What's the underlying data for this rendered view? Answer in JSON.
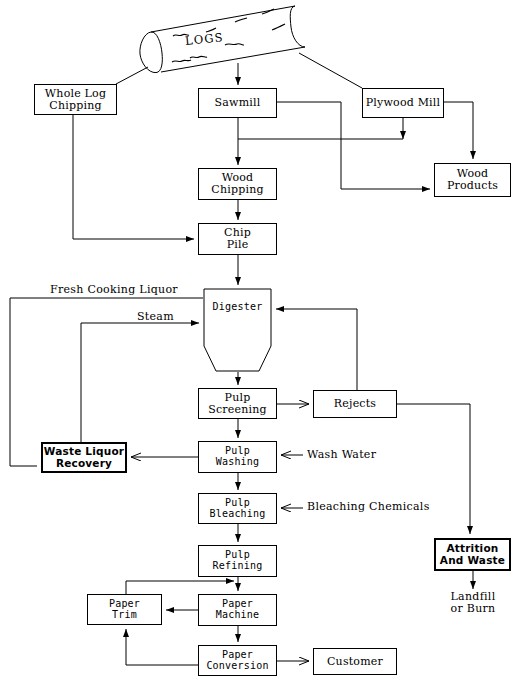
{
  "diagram": {
    "source_shape": {
      "label": "LOGS",
      "shape": "cylinder"
    },
    "nodes": [
      {
        "id": "whole_log_chipping",
        "label": "Whole Log\nChipping",
        "x": 34,
        "y": 84,
        "w": 83,
        "h": 31,
        "style": "plain"
      },
      {
        "id": "sawmill",
        "label": "Sawmill",
        "x": 198,
        "y": 88,
        "w": 79,
        "h": 30,
        "style": "plain"
      },
      {
        "id": "plywood_mill",
        "label": "Plywood Mill",
        "x": 362,
        "y": 88,
        "w": 82,
        "h": 30,
        "style": "plain"
      },
      {
        "id": "wood_chipping",
        "label": "Wood\nChipping",
        "x": 198,
        "y": 168,
        "w": 79,
        "h": 32,
        "style": "plain"
      },
      {
        "id": "wood_products",
        "label": "Wood\nProducts",
        "x": 434,
        "y": 163,
        "w": 77,
        "h": 34,
        "style": "plain"
      },
      {
        "id": "chip_pile",
        "label": "Chip\nPile",
        "x": 198,
        "y": 223,
        "w": 79,
        "h": 32,
        "style": "plain"
      },
      {
        "id": "digester",
        "label": "Digester",
        "x": 203,
        "y": 288,
        "w": 69,
        "h": 84,
        "style": "vessel"
      },
      {
        "id": "pulp_screening",
        "label": "Pulp\nScreening",
        "x": 198,
        "y": 388,
        "w": 79,
        "h": 31,
        "style": "plain"
      },
      {
        "id": "rejects",
        "label": "Rejects",
        "x": 313,
        "y": 390,
        "w": 84,
        "h": 28,
        "style": "plain"
      },
      {
        "id": "waste_liquor_recovery",
        "label": "Waste Liquor\nRecovery",
        "x": 41,
        "y": 442,
        "w": 86,
        "h": 31,
        "style": "bold"
      },
      {
        "id": "pulp_washing",
        "label": "Pulp\nWashing",
        "x": 198,
        "y": 441,
        "w": 79,
        "h": 32,
        "style": "mono"
      },
      {
        "id": "pulp_bleaching",
        "label": "Pulp\nBleaching",
        "x": 198,
        "y": 493,
        "w": 79,
        "h": 31,
        "style": "mono"
      },
      {
        "id": "pulp_refining",
        "label": "Pulp\nRefining",
        "x": 198,
        "y": 545,
        "w": 79,
        "h": 32,
        "style": "mono"
      },
      {
        "id": "attrition_and_waste",
        "label": "Attrition\nAnd Waste",
        "x": 434,
        "y": 538,
        "w": 77,
        "h": 33,
        "style": "bold"
      },
      {
        "id": "paper_trim",
        "label": "Paper\nTrim",
        "x": 87,
        "y": 594,
        "w": 75,
        "h": 31,
        "style": "mono"
      },
      {
        "id": "paper_machine",
        "label": "Paper\nMachine",
        "x": 198,
        "y": 594,
        "w": 79,
        "h": 32,
        "style": "mono"
      },
      {
        "id": "paper_conversion",
        "label": "Paper\nConversion",
        "x": 198,
        "y": 645,
        "w": 79,
        "h": 31,
        "style": "mono"
      },
      {
        "id": "customer",
        "label": "Customer",
        "x": 313,
        "y": 648,
        "w": 84,
        "h": 27,
        "style": "plain"
      }
    ],
    "free_labels": [
      {
        "id": "fresh_cooking_liquor",
        "text": "Fresh Cooking Liquor",
        "x": 50,
        "y": 284
      },
      {
        "id": "steam",
        "text": "Steam",
        "x": 137,
        "y": 311
      },
      {
        "id": "wash_water",
        "text": "Wash Water",
        "x": 307,
        "y": 449
      },
      {
        "id": "bleaching_chemicals",
        "text": "Bleaching Chemicals",
        "x": 307,
        "y": 501
      },
      {
        "id": "landfill_or_burn",
        "text": "Landfill\nor Burn",
        "x": 444,
        "y": 593
      }
    ],
    "edges": [
      {
        "from": "LOGS",
        "to": "whole_log_chipping",
        "kind": "diagonal"
      },
      {
        "from": "LOGS",
        "to": "sawmill",
        "kind": "arrow-down"
      },
      {
        "from": "LOGS",
        "to": "plywood_mill",
        "kind": "diagonal"
      },
      {
        "from": "whole_log_chipping",
        "to": "chip_pile",
        "kind": "elbow"
      },
      {
        "from": "sawmill",
        "to": "wood_chipping",
        "kind": "arrow-down"
      },
      {
        "from": "sawmill",
        "to": "wood_products",
        "kind": "elbow"
      },
      {
        "from": "plywood_mill",
        "to": "wood_products",
        "kind": "elbow"
      },
      {
        "from": "plywood_mill",
        "to": "wood_chipping_line",
        "kind": "elbow"
      },
      {
        "from": "wood_chipping",
        "to": "chip_pile",
        "kind": "arrow-down"
      },
      {
        "from": "chip_pile",
        "to": "digester",
        "kind": "arrow-down"
      },
      {
        "from": "fresh_cooking_liquor",
        "to": "digester",
        "kind": "feed"
      },
      {
        "from": "steam",
        "to": "digester",
        "kind": "feed"
      },
      {
        "from": "digester",
        "to": "pulp_screening",
        "kind": "arrow-down"
      },
      {
        "from": "pulp_screening",
        "to": "rejects",
        "kind": "arrow-right"
      },
      {
        "from": "rejects",
        "to": "digester",
        "kind": "recycle"
      },
      {
        "from": "rejects",
        "to": "attrition_and_waste",
        "kind": "elbow"
      },
      {
        "from": "pulp_screening",
        "to": "pulp_washing",
        "kind": "arrow-down"
      },
      {
        "from": "pulp_washing",
        "to": "waste_liquor_recovery",
        "kind": "arrow-left"
      },
      {
        "from": "wash_water",
        "to": "pulp_washing",
        "kind": "feed"
      },
      {
        "from": "waste_liquor_recovery",
        "to": "digester",
        "kind": "recycle"
      },
      {
        "from": "pulp_washing",
        "to": "pulp_bleaching",
        "kind": "arrow-down"
      },
      {
        "from": "bleaching_chemicals",
        "to": "pulp_bleaching",
        "kind": "feed"
      },
      {
        "from": "pulp_bleaching",
        "to": "pulp_refining",
        "kind": "arrow-down"
      },
      {
        "from": "pulp_refining",
        "to": "paper_machine",
        "kind": "arrow-down"
      },
      {
        "from": "paper_machine",
        "to": "paper_trim",
        "kind": "arrow-left"
      },
      {
        "from": "paper_trim",
        "to": "pulp_refining_line",
        "kind": "recycle"
      },
      {
        "from": "paper_machine",
        "to": "paper_conversion",
        "kind": "arrow-down"
      },
      {
        "from": "paper_conversion",
        "to": "paper_trim",
        "kind": "recycle"
      },
      {
        "from": "paper_conversion",
        "to": "customer",
        "kind": "arrow-right"
      },
      {
        "from": "attrition_and_waste",
        "to": "landfill_or_burn",
        "kind": "arrow-down"
      }
    ]
  }
}
